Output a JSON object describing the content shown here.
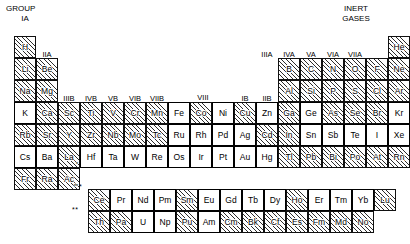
{
  "labels": {
    "group": "GROUP",
    "group_ia": "IA",
    "inert_line1": "INERT",
    "inert_line2": "GASES",
    "viii": "VIII",
    "series_star": "*",
    "series_dstar": "**",
    "la_marker": "*",
    "ac_marker": "**"
  },
  "group_headers": {
    "IIA": "IIA",
    "IIIB": "IIIB",
    "IVB": "IVB",
    "VB": "VB",
    "VIB": "VIB",
    "VIIB": "VIIB",
    "IB": "IB",
    "IIB": "IIB",
    "IIIA": "IIIA",
    "IVA": "IVA",
    "VA": "VA",
    "VIA": "VIA",
    "VIIA": "VIIA"
  },
  "colors": {
    "hatch_line": "#2b2b2b",
    "cell_border": "#111111",
    "highlight_border": "#000000",
    "background": "#ffffff"
  },
  "chart_data": {
    "type": "table",
    "note": "Hatched cells are one category; white (unshaded, bold-bordered) cells are the highlighted category.",
    "columns": 18,
    "rows": [
      {
        "row": 1,
        "cells": [
          {
            "col": 1,
            "symbol": "H",
            "style": "hatched"
          },
          {
            "col": 18,
            "symbol": "He",
            "style": "hatched"
          }
        ]
      },
      {
        "row": 2,
        "cells": [
          {
            "col": 1,
            "symbol": "Li",
            "style": "hatched"
          },
          {
            "col": 2,
            "symbol": "Be",
            "style": "hatched"
          },
          {
            "col": 13,
            "symbol": "B",
            "style": "hatched"
          },
          {
            "col": 14,
            "symbol": "C",
            "style": "hatched"
          },
          {
            "col": 15,
            "symbol": "N",
            "style": "hatched"
          },
          {
            "col": 16,
            "symbol": "O",
            "style": "hatched"
          },
          {
            "col": 17,
            "symbol": "F",
            "style": "hatched"
          },
          {
            "col": 18,
            "symbol": "Ne",
            "style": "hatched"
          }
        ]
      },
      {
        "row": 3,
        "cells": [
          {
            "col": 1,
            "symbol": "Na",
            "style": "hatched"
          },
          {
            "col": 2,
            "symbol": "Mg",
            "style": "hatched"
          },
          {
            "col": 13,
            "symbol": "Al",
            "style": "hatched"
          },
          {
            "col": 14,
            "symbol": "Si",
            "style": "hatched"
          },
          {
            "col": 15,
            "symbol": "P",
            "style": "hatched"
          },
          {
            "col": 16,
            "symbol": "S",
            "style": "hatched"
          },
          {
            "col": 17,
            "symbol": "Cl",
            "style": "hatched"
          },
          {
            "col": 18,
            "symbol": "Ar",
            "style": "hatched"
          }
        ]
      },
      {
        "row": 4,
        "cells": [
          {
            "col": 1,
            "symbol": "K",
            "style": "white"
          },
          {
            "col": 2,
            "symbol": "Ca",
            "style": "hatched"
          },
          {
            "col": 3,
            "symbol": "Sc",
            "style": "hatched"
          },
          {
            "col": 4,
            "symbol": "Ti",
            "style": "hatched"
          },
          {
            "col": 5,
            "symbol": "V",
            "style": "hatched"
          },
          {
            "col": 6,
            "symbol": "Cr",
            "style": "hatched"
          },
          {
            "col": 7,
            "symbol": "Mn",
            "style": "hatched"
          },
          {
            "col": 8,
            "symbol": "Fe",
            "style": "white"
          },
          {
            "col": 9,
            "symbol": "Co",
            "style": "hatched"
          },
          {
            "col": 10,
            "symbol": "Ni",
            "style": "white"
          },
          {
            "col": 11,
            "symbol": "Cu",
            "style": "hatched"
          },
          {
            "col": 12,
            "symbol": "Zn",
            "style": "white"
          },
          {
            "col": 13,
            "symbol": "Ga",
            "style": "hatched"
          },
          {
            "col": 14,
            "symbol": "Ge",
            "style": "white"
          },
          {
            "col": 15,
            "symbol": "As",
            "style": "hatched"
          },
          {
            "col": 16,
            "symbol": "Se",
            "style": "hatched"
          },
          {
            "col": 17,
            "symbol": "Br",
            "style": "hatched"
          },
          {
            "col": 18,
            "symbol": "Kr",
            "style": "white"
          }
        ]
      },
      {
        "row": 5,
        "cells": [
          {
            "col": 1,
            "symbol": "Rb",
            "style": "hatched"
          },
          {
            "col": 2,
            "symbol": "Sr",
            "style": "hatched"
          },
          {
            "col": 3,
            "symbol": "Y",
            "style": "hatched"
          },
          {
            "col": 4,
            "symbol": "Zr",
            "style": "hatched"
          },
          {
            "col": 5,
            "symbol": "Nb",
            "style": "hatched"
          },
          {
            "col": 6,
            "symbol": "Mo",
            "style": "hatched"
          },
          {
            "col": 7,
            "symbol": "Tc",
            "style": "hatched"
          },
          {
            "col": 8,
            "symbol": "Ru",
            "style": "white"
          },
          {
            "col": 9,
            "symbol": "Rh",
            "style": "white"
          },
          {
            "col": 10,
            "symbol": "Pd",
            "style": "white"
          },
          {
            "col": 11,
            "symbol": "Ag",
            "style": "white"
          },
          {
            "col": 12,
            "symbol": "Cd",
            "style": "hatched"
          },
          {
            "col": 13,
            "symbol": "In",
            "style": "hatched"
          },
          {
            "col": 14,
            "symbol": "Sn",
            "style": "white"
          },
          {
            "col": 15,
            "symbol": "Sb",
            "style": "white"
          },
          {
            "col": 16,
            "symbol": "Te",
            "style": "white"
          },
          {
            "col": 17,
            "symbol": "I",
            "style": "white"
          },
          {
            "col": 18,
            "symbol": "Xe",
            "style": "white"
          }
        ]
      },
      {
        "row": 6,
        "cells": [
          {
            "col": 1,
            "symbol": "Cs",
            "style": "white"
          },
          {
            "col": 2,
            "symbol": "Ba",
            "style": "white"
          },
          {
            "col": 3,
            "symbol": "La",
            "style": "hatched",
            "marker": "*"
          },
          {
            "col": 4,
            "symbol": "Hf",
            "style": "white"
          },
          {
            "col": 5,
            "symbol": "Ta",
            "style": "white"
          },
          {
            "col": 6,
            "symbol": "W",
            "style": "white"
          },
          {
            "col": 7,
            "symbol": "Re",
            "style": "white"
          },
          {
            "col": 8,
            "symbol": "Os",
            "style": "white"
          },
          {
            "col": 9,
            "symbol": "Ir",
            "style": "white"
          },
          {
            "col": 10,
            "symbol": "Pt",
            "style": "white"
          },
          {
            "col": 11,
            "symbol": "Au",
            "style": "white"
          },
          {
            "col": 12,
            "symbol": "Hg",
            "style": "white"
          },
          {
            "col": 13,
            "symbol": "Tl",
            "style": "hatched"
          },
          {
            "col": 14,
            "symbol": "Pb",
            "style": "hatched"
          },
          {
            "col": 15,
            "symbol": "Bi",
            "style": "hatched"
          },
          {
            "col": 16,
            "symbol": "Po",
            "style": "hatched"
          },
          {
            "col": 17,
            "symbol": "At",
            "style": "hatched"
          },
          {
            "col": 18,
            "symbol": "Rn",
            "style": "hatched"
          }
        ]
      },
      {
        "row": 7,
        "cells": [
          {
            "col": 1,
            "symbol": "Fr",
            "style": "hatched"
          },
          {
            "col": 2,
            "symbol": "Ra",
            "style": "hatched"
          },
          {
            "col": 3,
            "symbol": "Ac",
            "style": "hatched",
            "marker": "**"
          }
        ]
      }
    ],
    "lanthanides": {
      "marker": "*",
      "cells": [
        {
          "symbol": "Ce",
          "style": "hatched"
        },
        {
          "symbol": "Pr",
          "style": "white"
        },
        {
          "symbol": "Nd",
          "style": "white"
        },
        {
          "symbol": "Pm",
          "style": "white"
        },
        {
          "symbol": "Sm",
          "style": "hatched"
        },
        {
          "symbol": "Eu",
          "style": "white"
        },
        {
          "symbol": "Gd",
          "style": "white"
        },
        {
          "symbol": "Tb",
          "style": "white"
        },
        {
          "symbol": "Dy",
          "style": "white"
        },
        {
          "symbol": "Ho",
          "style": "hatched"
        },
        {
          "symbol": "Er",
          "style": "white"
        },
        {
          "symbol": "Tm",
          "style": "white"
        },
        {
          "symbol": "Yb",
          "style": "white"
        },
        {
          "symbol": "Lu",
          "style": "hatched"
        }
      ]
    },
    "actinides": {
      "marker": "**",
      "cells": [
        {
          "symbol": "Th",
          "style": "hatched"
        },
        {
          "symbol": "Pa",
          "style": "hatched"
        },
        {
          "symbol": "U",
          "style": "white"
        },
        {
          "symbol": "Np",
          "style": "white"
        },
        {
          "symbol": "Pu",
          "style": "hatched"
        },
        {
          "symbol": "Am",
          "style": "white"
        },
        {
          "symbol": "Cm",
          "style": "hatched"
        },
        {
          "symbol": "Bk",
          "style": "hatched"
        },
        {
          "symbol": "Cf",
          "style": "hatched"
        },
        {
          "symbol": "Es",
          "style": "hatched"
        },
        {
          "symbol": "Fm",
          "style": "hatched"
        },
        {
          "symbol": "Md",
          "style": "hatched"
        },
        {
          "symbol": "No",
          "style": "hatched"
        }
      ]
    }
  }
}
